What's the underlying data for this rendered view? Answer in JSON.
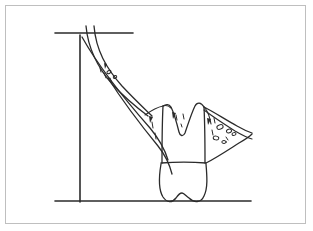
{
  "figure": {
    "description": "Hand-drawn anatomical line diagram of a tooth in cross-section with surrounding soft tissue and two horizontal reference lines plus one vertical reference line",
    "background_color": "#ffffff",
    "ink_color": "#2b2b2b",
    "frame_color": "#bfbfbf",
    "width": 313,
    "height": 231
  },
  "frame": {
    "name": "figure-border",
    "left": 5,
    "top": 5,
    "width": 301,
    "height": 219
  },
  "reference_lines": {
    "top_horizontal": {
      "label": "upper reference line",
      "x1": 55,
      "y1": 33,
      "x2": 133,
      "y2": 33
    },
    "bottom_horizontal": {
      "label": "lower reference line",
      "x1": 55,
      "y1": 201,
      "x2": 251,
      "y2": 201
    },
    "vertical": {
      "label": "vertical reference line",
      "x1": 80,
      "y1": 35,
      "x2": 80,
      "y2": 202
    }
  },
  "shapes": {
    "left_band": {
      "label": "left soft-tissue band",
      "outer": "M 86,26 C 88,48 96,66 113,85 C 128,101 140,110 148,116",
      "inner": "M 94,26 C 96,50 106,68 122,86 C 136,101 146,110 152,116"
    },
    "left_lower_edge": {
      "label": "left inferior margin",
      "path": "M 82,37 C 96,62 120,94 150,128 C 160,140 165,150 168,160"
    },
    "left_lower_edge_2": {
      "label": "left inferior margin inner",
      "path": "M 108,78 C 122,100 140,124 158,146 C 166,156 170,166 172,174"
    },
    "gingival_left": {
      "label": "left gingival contour",
      "path": "M 145,115 C 152,110 158,107 163,106 C 166,105 169,106 171,108"
    },
    "crown_outline": {
      "label": "tooth crown outline",
      "path": "M 163,106 C 166,104 169,104 171,107 C 174,113 177,124 179,132 C 180,136 183,137 185,133 C 188,124 192,112 195,106 C 197,102 201,102 204,107"
    },
    "crown_left_wall": {
      "label": "crown left wall",
      "path": "M 163,106 C 162,126 162,148 162,163"
    },
    "crown_right_wall": {
      "label": "crown right wall",
      "path": "M 204,107 C 205,127 205,148 205,163"
    },
    "cemento_enamel_junction": {
      "label": "cervical line",
      "path": "M 161,163 C 176,162 192,162 206,163"
    },
    "root_outline": {
      "label": "tooth root outline",
      "path": "M 161,164 C 159,176 158,189 163,197 C 167,203 172,203 176,198 C 178,195 180,193 182,193 C 184,193 186,196 189,198 C 194,203 201,203 204,196 C 208,188 207,176 206,164"
    },
    "right_wing_upper": {
      "label": "right soft-tissue upper margin",
      "path": "M 204,107 C 214,112 226,120 237,126 C 244,130 249,132 252,133"
    },
    "right_wing_lower": {
      "label": "right soft-tissue lower margin",
      "path": "M 206,163 C 216,158 228,150 239,143 C 246,139 250,136 252,134"
    },
    "right_wing_inner": {
      "label": "right soft-tissue inner margin",
      "path": "M 204,110 C 212,116 224,124 235,131 C 242,135 248,138 252,139"
    },
    "gingival_crest_right": {
      "label": "right gingival crest",
      "path": "M 205,108 C 208,112 210,118 211,124"
    }
  },
  "stipple_marks": {
    "label": "tissue texture stipple marks",
    "dashes": [
      {
        "x1": 104,
        "y1": 73,
        "x2": 106,
        "y2": 78
      },
      {
        "x1": 110,
        "y1": 78,
        "x2": 112,
        "y2": 83
      },
      {
        "x1": 100,
        "y1": 68,
        "x2": 101,
        "y2": 72
      },
      {
        "x1": 152,
        "y1": 122,
        "x2": 153,
        "y2": 128
      },
      {
        "x1": 155,
        "y1": 133,
        "x2": 156,
        "y2": 139
      },
      {
        "x1": 176,
        "y1": 115,
        "x2": 177,
        "y2": 120
      },
      {
        "x1": 183,
        "y1": 114,
        "x2": 184,
        "y2": 119
      },
      {
        "x1": 181,
        "y1": 124,
        "x2": 182,
        "y2": 127
      },
      {
        "x1": 214,
        "y1": 118,
        "x2": 215,
        "y2": 123
      },
      {
        "x1": 212,
        "y1": 130,
        "x2": 213,
        "y2": 135
      },
      {
        "x1": 226,
        "y1": 137,
        "x2": 228,
        "y2": 140
      }
    ],
    "triangles": [
      {
        "points": "149,116 153,117 150,123"
      },
      {
        "points": "172,112 176,113 173,119"
      },
      {
        "points": "207,118 211,119 208,125"
      },
      {
        "points": "104,63 107,64 105,69"
      }
    ],
    "blobs": [
      {
        "cx": 220,
        "cy": 127,
        "rx": 3.2,
        "ry": 2.2,
        "rot": -20
      },
      {
        "cx": 229,
        "cy": 131,
        "rx": 2.6,
        "ry": 1.8,
        "rot": -15
      },
      {
        "cx": 216,
        "cy": 138,
        "rx": 2.8,
        "ry": 1.9,
        "rot": 10
      },
      {
        "cx": 224,
        "cy": 142,
        "rx": 2.2,
        "ry": 1.5,
        "rot": 0
      },
      {
        "cx": 234,
        "cy": 134,
        "rx": 2.0,
        "ry": 1.4,
        "rot": -10
      },
      {
        "cx": 109,
        "cy": 72,
        "rx": 2.2,
        "ry": 1.5,
        "rot": -30
      },
      {
        "cx": 115,
        "cy": 77,
        "rx": 1.8,
        "ry": 1.3,
        "rot": -25
      }
    ]
  }
}
